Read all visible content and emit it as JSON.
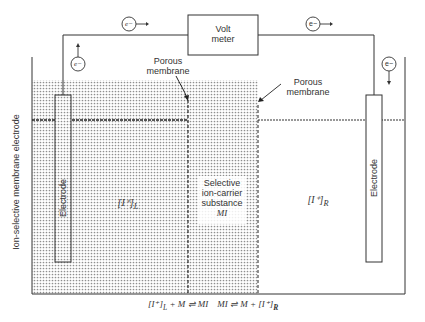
{
  "diagram": {
    "type": "electrochemical cell schematic",
    "voltmeter": {
      "line1": "Volt",
      "line2": "meter"
    },
    "electron_symbol": "e−",
    "labels": {
      "porous_membrane_left_1": "Porous",
      "porous_membrane_left_2": "membrane",
      "porous_membrane_right_1": "Porous",
      "porous_membrane_right_2": "membrane",
      "left_electrode": "Electrode",
      "right_electrode": "Electrode",
      "left_concentration": "[I⁺]",
      "left_subscript": "L",
      "right_concentration": "[I⁺]",
      "right_subscript": "R",
      "carrier_1": "Selective",
      "carrier_2": "ion-carrier",
      "carrier_3": "substance",
      "carrier_4": "MI",
      "side_label": "Ion-selective membrane electrode"
    },
    "equation": {
      "left_part": "[I⁺]",
      "left_sub": "L",
      "left_rest": " + M ⇌ MI",
      "right_part": "MI ⇌ M + [I⁺]",
      "right_sub": "R"
    },
    "colors": {
      "line": "#333333",
      "stipple": "#9a9a9a",
      "background": "#ffffff"
    }
  }
}
